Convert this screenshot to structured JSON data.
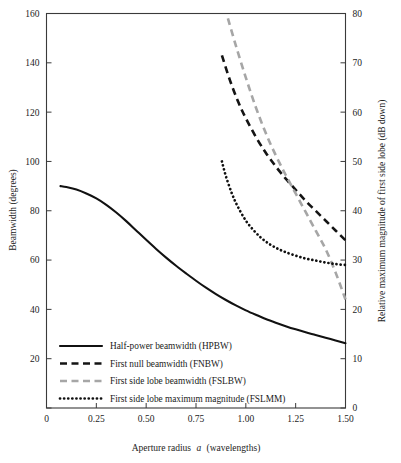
{
  "chart_data": {
    "type": "line",
    "title": "",
    "xlabel": "Aperture radius a (wavelengths)",
    "xlabel_plain": "Aperture radius ",
    "xlabel_italic": "a",
    "xlabel_tail": " (wavelengths)",
    "ylabel": "Beamwidth (degrees)",
    "ylabel_right": "Relative maximum magnitude of first side lobe (dB down)",
    "xlim": [
      0,
      1.5
    ],
    "ylim": [
      0,
      160
    ],
    "ylim_right": [
      0,
      80
    ],
    "grid": false,
    "legend_position": "lower-left-inside",
    "xticks": [
      0,
      0.25,
      0.5,
      0.75,
      1.0,
      1.25,
      1.5
    ],
    "xtick_labels": [
      "0",
      "0.25",
      "0.50",
      "0.75",
      "1.00",
      "1.25",
      "1.50"
    ],
    "yticks": [
      0,
      20,
      40,
      60,
      80,
      100,
      120,
      140,
      160
    ],
    "ytick_labels": [
      "0",
      "20",
      "40",
      "60",
      "80",
      "100",
      "120",
      "140",
      "160"
    ],
    "yticks_right": [
      0,
      10,
      20,
      30,
      40,
      50,
      60,
      70,
      80
    ],
    "ytick_labels_right": [
      "0",
      "10",
      "20",
      "30",
      "40",
      "50",
      "60",
      "70",
      "80"
    ],
    "series": [
      {
        "name": "Half-power beamwidth (HPBW)",
        "axis": "left",
        "style": "solid",
        "color": "#111111",
        "x": [
          0.07,
          0.1,
          0.15,
          0.2,
          0.25,
          0.3,
          0.35,
          0.4,
          0.45,
          0.5,
          0.55,
          0.6,
          0.65,
          0.7,
          0.75,
          0.8,
          0.85,
          0.9,
          0.95,
          1.0,
          1.05,
          1.1,
          1.15,
          1.2,
          1.25,
          1.3,
          1.35,
          1.4,
          1.45,
          1.5
        ],
        "y": [
          90.0,
          89.6,
          88.6,
          87.0,
          85.0,
          82.4,
          79.3,
          75.8,
          72.0,
          68.2,
          64.5,
          61.0,
          57.7,
          54.6,
          51.6,
          48.8,
          46.2,
          43.8,
          41.6,
          39.6,
          37.8,
          36.1,
          34.6,
          33.2,
          31.9,
          30.7,
          29.6,
          28.5,
          27.4,
          26.3
        ]
      },
      {
        "name": "First null beamwidth (FNBW)",
        "axis": "left",
        "style": "dashed",
        "color": "#141414",
        "x": [
          0.88,
          0.92,
          0.96,
          1.0,
          1.05,
          1.1,
          1.15,
          1.2,
          1.25,
          1.3,
          1.35,
          1.4,
          1.45,
          1.5
        ],
        "y": [
          143.0,
          133.0,
          124.5,
          117.5,
          110.0,
          103.5,
          98.0,
          93.0,
          88.5,
          84.0,
          80.0,
          76.0,
          72.0,
          68.0
        ]
      },
      {
        "name": "First side lobe beamwidth (FSLBW)",
        "axis": "left",
        "style": "dashed",
        "color": "#a6a6a6",
        "x": [
          0.91,
          0.95,
          1.0,
          1.05,
          1.1,
          1.15,
          1.2,
          1.25,
          1.3,
          1.35,
          1.4,
          1.45,
          1.5
        ],
        "y": [
          158.0,
          147.0,
          134.0,
          122.0,
          111.5,
          102.5,
          94.5,
          87.0,
          79.5,
          72.0,
          64.5,
          55.0,
          44.0
        ]
      },
      {
        "name": "First side lobe maximum magnitude (FSLMM)",
        "axis": "right",
        "style": "dotted",
        "color": "#101010",
        "x": [
          0.88,
          0.9,
          0.93,
          0.96,
          1.0,
          1.04,
          1.08,
          1.12,
          1.16,
          1.2,
          1.25,
          1.3,
          1.35,
          1.4,
          1.45,
          1.5
        ],
        "y": [
          50.0,
          47.0,
          43.5,
          40.8,
          38.0,
          36.0,
          34.4,
          33.2,
          32.3,
          31.6,
          30.9,
          30.3,
          29.9,
          29.5,
          29.2,
          29.0
        ]
      }
    ]
  },
  "legend": {
    "items": [
      {
        "label": "Half-power beamwidth (HPBW)",
        "style": "solid",
        "color": "#111111"
      },
      {
        "label": "First null beamwidth (FNBW)",
        "style": "dashed",
        "color": "#141414"
      },
      {
        "label": "First side lobe beamwidth (FSLBW)",
        "style": "dashed",
        "color": "#a6a6a6"
      },
      {
        "label": "First side lobe maximum magnitude (FSLMM)",
        "style": "dotted",
        "color": "#101010"
      }
    ]
  },
  "axes": {
    "left_title": "Beamwidth (degrees)",
    "right_title": "Relative maximum magnitude of first side lobe (dB down)",
    "x_title_lead": "Aperture radius",
    "x_title_var": "a",
    "x_title_tail": "(wavelengths)"
  }
}
